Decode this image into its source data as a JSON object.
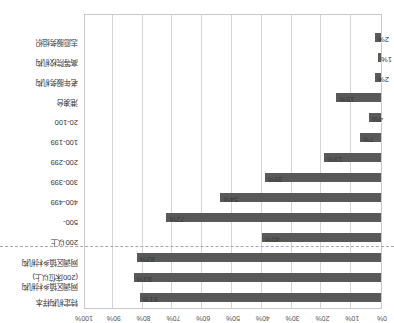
{
  "chart_data": {
    "type": "bar",
    "orientation": "horizontal",
    "title": "",
    "xlabel": "",
    "ylabel": "",
    "xlim": [
      0,
      100
    ],
    "grid": true,
    "legend": "none",
    "unit": "%",
    "bar_color": "#595959",
    "gridline_color": "#d4d4d4",
    "separator_color": "#9aa7c7",
    "axis_ticks": [
      "0%",
      "10%",
      "20%",
      "30%",
      "40%",
      "50%",
      "60%",
      "70%",
      "80%",
      "90%",
      "100%"
    ],
    "categories": [
      "特定机构样本",
      "网调区镇乡村机构\n(200床位以上)",
      "网调区镇乡村机构",
      "200以上",
      "500-",
      "400-499",
      "300-399",
      "200-299",
      "100-199",
      "20-100",
      "港澳台",
      "老年服务机构",
      "高等院校机构",
      "志愿服务组织"
    ],
    "values": [
      81,
      83,
      82,
      40,
      72,
      54,
      39,
      19,
      7,
      4,
      15,
      2,
      1,
      2
    ],
    "value_labels": [
      "81%",
      "83%",
      "82%",
      "40%",
      "72%",
      "54%",
      "39%",
      "19%",
      "7%",
      "4%",
      "15%",
      "2%",
      "1%",
      "2%"
    ],
    "separator_after_index": 2
  }
}
